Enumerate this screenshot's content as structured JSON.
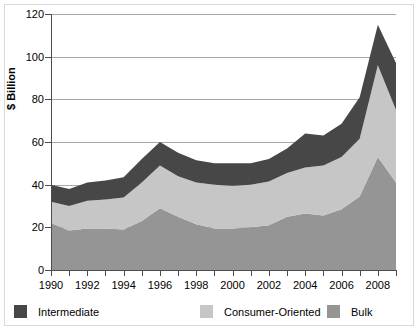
{
  "chart_data": {
    "type": "area",
    "stacked": true,
    "title": "",
    "subtitle": "",
    "xlabel": "",
    "ylabel": "$ Billion",
    "ylim": [
      0,
      120
    ],
    "xlim": [
      1990,
      2009
    ],
    "grid": true,
    "legend_position": "bottom",
    "x": [
      1990,
      1991,
      1992,
      1993,
      1994,
      1995,
      1996,
      1997,
      1998,
      1999,
      2000,
      2001,
      2002,
      2003,
      2004,
      2005,
      2006,
      2007,
      2008,
      2009
    ],
    "xtick_labels": [
      "1990",
      "1992",
      "1994",
      "1996",
      "1998",
      "2000",
      "2002",
      "2004",
      "2006",
      "2008"
    ],
    "xtick_values": [
      1990,
      1992,
      1994,
      1996,
      1998,
      2000,
      2002,
      2004,
      2006,
      2008
    ],
    "ytick_labels": [
      "0",
      "20",
      "40",
      "60",
      "80",
      "100",
      "120"
    ],
    "ytick_values": [
      0,
      20,
      40,
      60,
      80,
      100,
      120
    ],
    "stack_order_bottom_to_top": [
      "Bulk",
      "Consumer-Oriented",
      "Intermediate"
    ],
    "series": [
      {
        "name": "Bulk",
        "color": "#959595",
        "values": [
          22,
          18.5,
          19.5,
          19.5,
          19,
          23,
          29,
          25,
          21.5,
          19.5,
          19.5,
          20,
          21,
          25,
          26.5,
          25.5,
          28.5,
          34.5,
          53,
          41
        ]
      },
      {
        "name": "Consumer-Oriented",
        "color": "#c6c6c6",
        "values": [
          10,
          11.5,
          13,
          13.5,
          15,
          18,
          20,
          19,
          19.5,
          20.5,
          20,
          20,
          20.5,
          20.5,
          21.5,
          23.5,
          24.5,
          27,
          43,
          34
        ]
      },
      {
        "name": "Intermediate",
        "color": "#474747",
        "values": [
          8,
          8,
          8.5,
          9,
          9.5,
          11,
          11,
          11,
          10.5,
          10,
          10.5,
          10,
          10.5,
          11.5,
          16,
          14,
          15.5,
          19.5,
          19,
          22
        ]
      }
    ],
    "stacked_totals": [
      40,
      38,
      41,
      42,
      43.5,
      52,
      60,
      55,
      51.5,
      50,
      50,
      50,
      52,
      57,
      64,
      63,
      68.5,
      81,
      115,
      97
    ]
  },
  "axes": {
    "y_title": "$ Billion"
  },
  "legend": {
    "items": [
      {
        "label": "Intermediate",
        "color": "#474747"
      },
      {
        "label": "Consumer-Oriented",
        "color": "#c6c6c6"
      },
      {
        "label": "Bulk",
        "color": "#959595"
      }
    ]
  }
}
